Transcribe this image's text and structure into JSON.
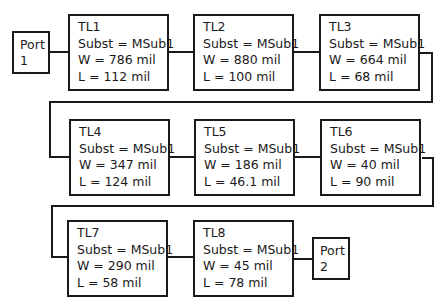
{
  "ports": [
    {
      "id": "port1",
      "line1": "Port",
      "line2": "1"
    },
    {
      "id": "port2",
      "line1": "Port",
      "line2": "2"
    }
  ],
  "lines": [
    {
      "name": "TL1",
      "subst": "Subst  = MSub1",
      "w": "W = 786 mil",
      "l": "L = 112 mil"
    },
    {
      "name": "TL2",
      "subst": "Subst  = MSub1",
      "w": "W = 880 mil",
      "l": "L = 100 mil"
    },
    {
      "name": "TL3",
      "subst": "Subst  = MSub1",
      "w": "W = 664 mil",
      "l": "L = 68 mil"
    },
    {
      "name": "TL4",
      "subst": "Subst  = MSub1",
      "w": "W = 347 mil",
      "l": "L = 124 mil"
    },
    {
      "name": "TL5",
      "subst": "Subst  = MSub1",
      "w": "W = 186 mil",
      "l": "L = 46.1 mil"
    },
    {
      "name": "TL6",
      "subst": "Subst  = MSub1",
      "w": "W = 40 mil",
      "l": "L = 90 mil"
    },
    {
      "name": "TL7",
      "subst": "Subst  = MSub1",
      "w": "W = 290 mil",
      "l": "L = 58 mil"
    },
    {
      "name": "TL8",
      "subst": "Subst  = MSub1",
      "w": "W = 45 mil",
      "l": "L = 78 mil"
    }
  ]
}
